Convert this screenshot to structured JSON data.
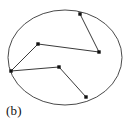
{
  "figure": {
    "panel_label": "(b)",
    "canvas": {
      "width": 133,
      "height": 126
    },
    "colors": {
      "background": "#ffffff",
      "boundary_stroke": "#4a4a4a",
      "chain_stroke": "#3a3a3a",
      "vertex_fill": "#111111",
      "label_text": "#111111"
    }
  },
  "chart_data": {
    "type": "scatter",
    "title": "",
    "subtitle": "",
    "xlabel": "",
    "ylabel": "",
    "annotations": [
      "(b)"
    ],
    "legend": [],
    "legend_position": "none",
    "grid": false,
    "axis_visible": false,
    "xlim": [
      0,
      133
    ],
    "ylim": [
      126,
      0
    ],
    "shapes": [
      {
        "name": "boundary-ellipse",
        "type": "ellipse",
        "cx": 65,
        "cy": 57.5,
        "rx": 57,
        "ry": 47.5,
        "stroke_width": 1.0
      }
    ],
    "series": [
      {
        "name": "polygonal-chain",
        "type": "polyline",
        "closed": false,
        "stroke_width": 1.0,
        "marker": "square",
        "marker_size": 3.4,
        "x": [
          80,
          99,
          38,
          11,
          59,
          86
        ],
        "y": [
          14,
          52,
          44,
          71,
          67,
          97
        ],
        "points": [
          {
            "id": "v1",
            "x": 80,
            "y": 14,
            "on_boundary": true
          },
          {
            "id": "v2",
            "x": 99,
            "y": 52,
            "on_boundary": false
          },
          {
            "id": "v3",
            "x": 38,
            "y": 44,
            "on_boundary": false
          },
          {
            "id": "v4",
            "x": 11,
            "y": 71,
            "on_boundary": true
          },
          {
            "id": "v5",
            "x": 59,
            "y": 67,
            "on_boundary": false
          },
          {
            "id": "v6",
            "x": 86,
            "y": 97,
            "on_boundary": true
          }
        ],
        "segments": [
          {
            "from": "v1",
            "to": "v2"
          },
          {
            "from": "v2",
            "to": "v3"
          },
          {
            "from": "v3",
            "to": "v4"
          },
          {
            "from": "v4",
            "to": "v5"
          },
          {
            "from": "v5",
            "to": "v6"
          }
        ]
      }
    ]
  }
}
